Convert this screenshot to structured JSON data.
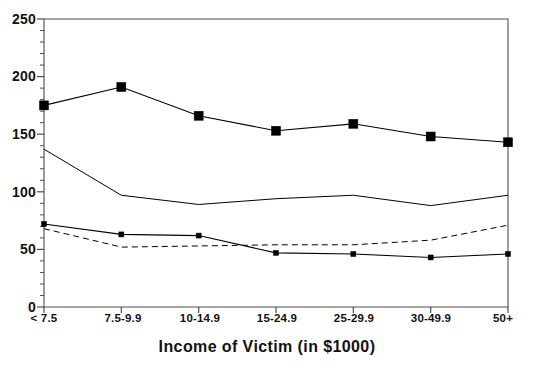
{
  "chart_data": {
    "type": "line",
    "title": "",
    "subtitle": "",
    "xlabel": "Income of Victim (in $1000)",
    "ylabel": "",
    "categories": [
      "< 7.5",
      "7.5-9.9",
      "10-14.9",
      "15-24.9",
      "25-29.9",
      "30-49.9",
      "50+"
    ],
    "ylim": [
      0,
      250
    ],
    "yticks": [
      0,
      50,
      100,
      150,
      200,
      250
    ],
    "yticklabels": [
      "0",
      "50",
      "100",
      "150",
      "200",
      "250"
    ],
    "y_minor_tick_interval": 10,
    "grid": false,
    "legend": "none",
    "series": [
      {
        "name": "series-1",
        "values": [
          175,
          191,
          166,
          153,
          159,
          148,
          143
        ],
        "style": "solid",
        "marker": "square-large",
        "color": "#000000"
      },
      {
        "name": "series-2",
        "values": [
          137,
          97,
          89,
          94,
          97,
          88,
          97
        ],
        "style": "solid",
        "marker": "none",
        "color": "#000000"
      },
      {
        "name": "series-3",
        "values": [
          72,
          63,
          62,
          47,
          46,
          43,
          46
        ],
        "style": "solid",
        "marker": "square-small",
        "color": "#000000"
      },
      {
        "name": "series-4",
        "values": [
          68,
          52,
          53,
          54,
          54,
          58,
          71
        ],
        "style": "dashed",
        "marker": "none",
        "color": "#000000"
      }
    ]
  },
  "axis": {
    "y_labels": [
      "250",
      "200",
      "150",
      "100",
      "50",
      "0"
    ],
    "x_labels": [
      "< 7.5",
      "7.5-9.9",
      "10-14.9",
      "15-24.9",
      "25-29.9",
      "30-49.9",
      "50+"
    ],
    "x_title": "Income of Victim (in $1000)"
  },
  "colors": {
    "axis": "#4d4d4d",
    "line": "#1a1a1a",
    "text": "#111111",
    "background": "#ffffff"
  }
}
